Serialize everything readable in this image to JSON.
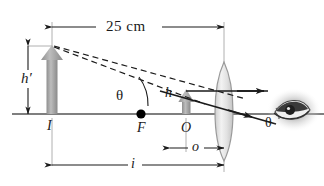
{
  "figure": {
    "type": "optics-ray-diagram",
    "colors": {
      "axis": "#4d4d4d",
      "ray": "#1a1a1a",
      "dashed_ray": "#1a1a1a",
      "object_arrow": "#8c8c8c",
      "image_arrow": "#9a9a9a",
      "lens": "#b3b3b3",
      "dimension": "#1a1a1a",
      "extension_line": "#b0b0b0",
      "label_text": "#1a1a1a",
      "focal_point": "#000000"
    }
  },
  "labels": {
    "dimension_top": "25  cm",
    "image_height": "h′",
    "object_height": "h",
    "image_point": "I",
    "focal_point": "F",
    "object_point": "O",
    "image_distance": "i",
    "object_distance": "o",
    "angle_image": "θ",
    "angle_eye": "θ"
  },
  "elements": {
    "optical_axis": "optical-axis",
    "lens": "converging-lens",
    "eye": "eye-illustration",
    "object_arrow": "object-arrow",
    "image_arrow": "image-arrow",
    "focal_point_dot": "focal-point-dot",
    "ray_parallel": "ray-parallel-to-axis",
    "ray_through_center": "ray-through-lens-center",
    "dashed_ray_upper": "dashed-virtual-ray-upper",
    "dashed_ray_lower": "dashed-virtual-ray-lower",
    "angle_arc_image": "angle-arc-at-image",
    "angle_arc_eye": "angle-arc-at-eye"
  }
}
